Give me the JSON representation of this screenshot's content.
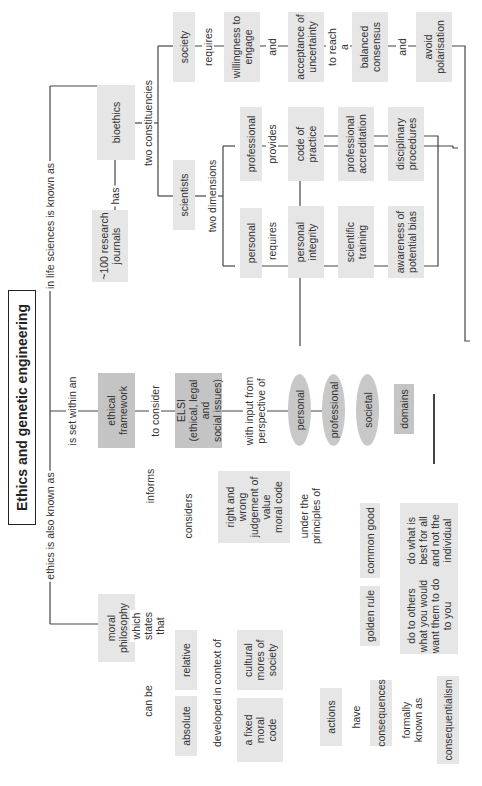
{
  "title": "Ethics and genetic engineering",
  "colors": {
    "node_light": "#e6e6e6",
    "node_dark": "#c4c4c4",
    "oval": "#c8c8c8",
    "line": "#444444"
  },
  "nodes": {
    "moral_philosophy": "moral\nphilosophy",
    "ethical_framework": "ethical\nframework",
    "bioethics": "bioethics",
    "research_journals": "~100 research\njournals",
    "elsi": "ELSI\n(ethical, legal and\nsocial issues)",
    "personal_domain": "personal",
    "professional_domain": "professional",
    "societal_domain": "societal",
    "domains": "domains",
    "scientists": "scientists",
    "society": "society",
    "sci_personal": "personal",
    "sci_professional": "professional",
    "personal_integrity": "personal\nintegrity",
    "scientific_training": "scientific\ntraining",
    "awareness_bias": "awareness of\npotential bias",
    "code_of_practice": "code of\npractice",
    "professional_accreditation": "professional\naccreditation",
    "disciplinary_procedures": "disciplinary\nprocedures",
    "willingness": "willingness to\nengage",
    "acceptance": "acceptance of\nuncertainty",
    "balanced_consensus": "balanced\nconsensus",
    "avoid_polarisation": "avoid\npolarisation",
    "right_wrong": "right and wrong\njudgement of\nvalue\nmoral code",
    "golden_rule": "golden rule",
    "common_good": "common good",
    "golden_rule_desc": "do to others\nwhat you would\nwant them to do\nto you",
    "common_good_desc": "do what is\nbest for all\nand not the\nindividual",
    "absolute": "absolute",
    "relative": "relative",
    "fixed_code": "a fixed\nmoral\ncode",
    "cultural_mores": "cultural\nmores of\nsociety",
    "actions": "actions",
    "consequences": "consequences",
    "consequentialism": "consequentialism"
  },
  "labels": {
    "also_known_as": "ethics is also known as",
    "is_set_within": "is set within an",
    "in_life_sciences": "in life sciences is known as",
    "has": "has",
    "two_constituencies": "two constituencies",
    "to_consider": "to consider",
    "with_input": "with input from\nperspective of",
    "informs": "informs",
    "two_dimensions": "two dimensions",
    "requires_personal": "requires",
    "provides": "provides",
    "requires_society": "requires",
    "and_1": "and",
    "to_reach": "to reach a",
    "and_2": "and",
    "considers": "considers",
    "under_principles": "under the\nprinciples of",
    "which_states": "which\nstates\nthat",
    "can_be": "can be",
    "developed_in": "developed in context of",
    "have": "have",
    "formally_known": "formally\nknown as"
  }
}
